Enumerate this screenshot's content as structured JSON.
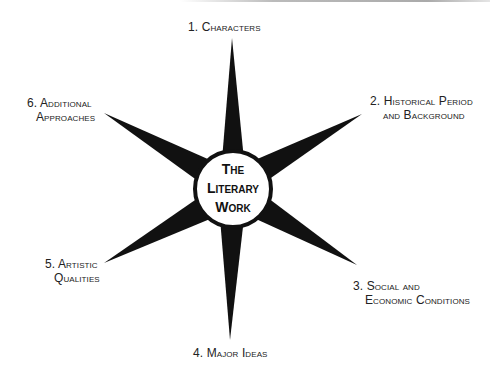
{
  "diagram": {
    "center": {
      "lines": [
        "The",
        "Literary",
        "Work"
      ]
    },
    "spokes": [
      {
        "id": 1,
        "lines": [
          "1. Characters"
        ]
      },
      {
        "id": 2,
        "lines": [
          "2. Historical Period",
          "and Background"
        ]
      },
      {
        "id": 3,
        "lines": [
          "3. Social and",
          "Economic Conditions"
        ]
      },
      {
        "id": 4,
        "lines": [
          "4. Major Ideas"
        ]
      },
      {
        "id": 5,
        "lines": [
          "5. Artistic",
          "Qualities"
        ]
      },
      {
        "id": 6,
        "lines": [
          "6. Additional",
          "Approaches"
        ]
      }
    ],
    "colors": {
      "spike": "#111111",
      "ring": "#111111",
      "fill": "#ffffff",
      "text": "#222222"
    }
  }
}
